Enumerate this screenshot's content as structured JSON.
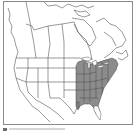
{
  "map": {
    "type": "range-map",
    "region": "North America (Canada, United States, northern Mexico)",
    "highlighted_region": "Eastern United States",
    "highlight_color": "#8c8c8c",
    "land_color": "#ffffff",
    "border_color": "#555555",
    "frame_color": "#8a8a8a"
  },
  "caption": {
    "text": ""
  }
}
